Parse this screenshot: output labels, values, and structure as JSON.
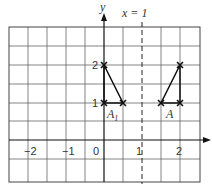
{
  "diagram": {
    "mirror_line_label": "x = 1",
    "axis_labels": {
      "y": "y"
    },
    "x_ticks": [
      "−2",
      "−1",
      "0",
      "1",
      "2"
    ],
    "y_ticks": [
      "1",
      "2"
    ],
    "shapes": [
      {
        "name": "A",
        "label": "A",
        "vertices": [
          [
            1.5,
            1
          ],
          [
            2,
            1
          ],
          [
            2,
            2
          ]
        ]
      },
      {
        "name": "A1",
        "label": "A",
        "subscript": "1",
        "vertices": [
          [
            0,
            1
          ],
          [
            0.5,
            1
          ],
          [
            0,
            2
          ]
        ]
      }
    ],
    "grid": {
      "x_range": [
        -2.5,
        2.5
      ],
      "y_range": [
        -1,
        3.0
      ],
      "cell": 0.5
    },
    "colors": {
      "grid": "#555555",
      "axis": "#111111",
      "shape": "#111111"
    }
  }
}
